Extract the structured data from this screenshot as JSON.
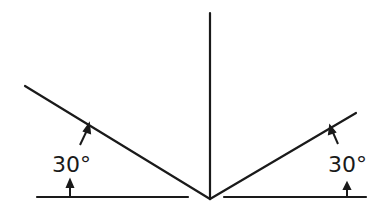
{
  "diagram": {
    "title": "",
    "left_angle": {
      "label": "30°",
      "value_deg": 30
    },
    "right_angle": {
      "label": "30°",
      "value_deg": 30
    },
    "colors": {
      "line": "#1a1a1a",
      "background": "#ffffff"
    }
  }
}
